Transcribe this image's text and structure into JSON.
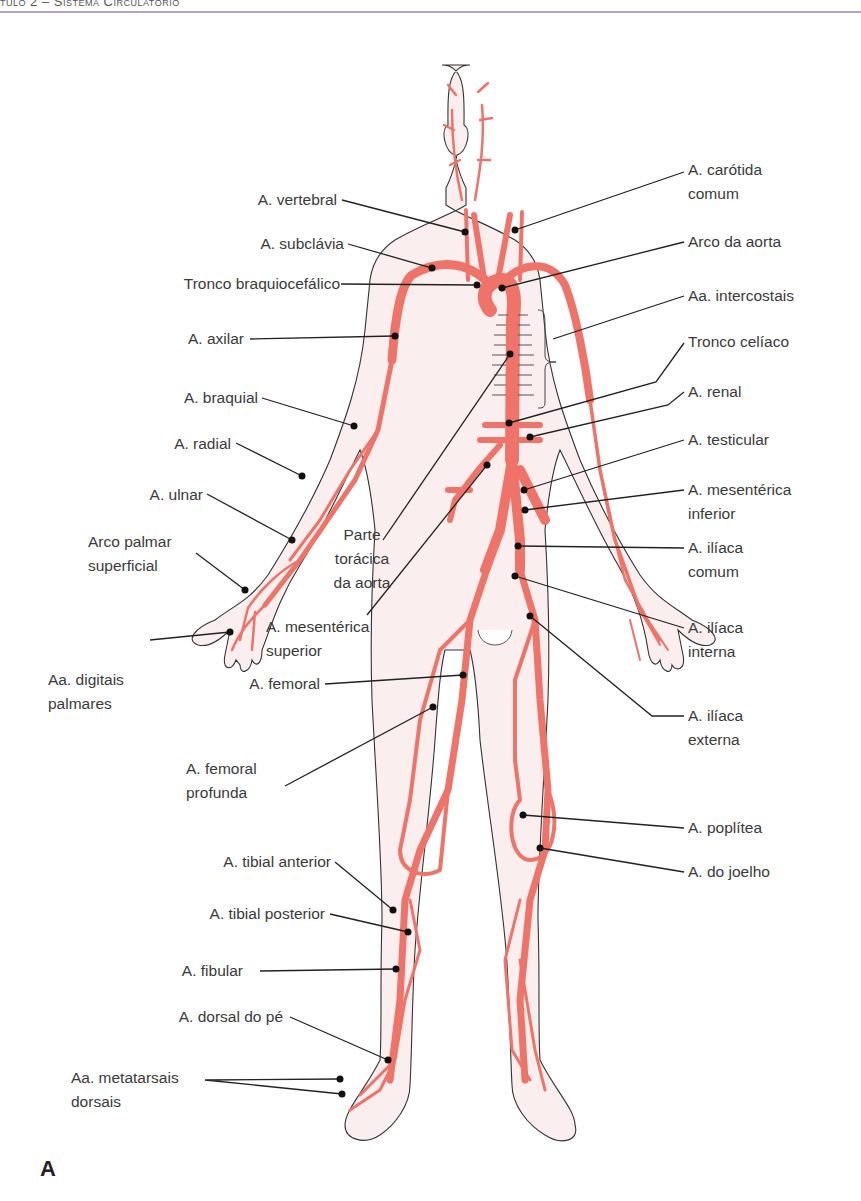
{
  "header": {
    "chapter_text": "tulo 2 – Sistema Circulatório",
    "rule_color": "#b9a0c9"
  },
  "figure": {
    "panel_letter": "A",
    "artery_color": "#ef7368",
    "skin_color": "#fbeeee",
    "outline_color": "#333333",
    "labels_left": [
      {
        "id": "vertebral",
        "text": "A. vertebral"
      },
      {
        "id": "subclavia",
        "text": "A. subclávia"
      },
      {
        "id": "tronco_braquiocefalico",
        "text": "Tronco braquiocefálico"
      },
      {
        "id": "axilar",
        "text": "A. axilar"
      },
      {
        "id": "braquial",
        "text": "A. braquial"
      },
      {
        "id": "radial",
        "text": "A. radial"
      },
      {
        "id": "ulnar",
        "text": "A. ulnar"
      },
      {
        "id": "arco_palmar",
        "line1": "Arco palmar",
        "line2": "superficial"
      },
      {
        "id": "digitais_palmares",
        "line1": "Aa. digitais",
        "line2": "palmares"
      },
      {
        "id": "femoral",
        "text": "A. femoral"
      },
      {
        "id": "femoral_profunda",
        "line1": "A. femoral",
        "line2": "profunda"
      },
      {
        "id": "tibial_anterior",
        "text": "A. tibial anterior"
      },
      {
        "id": "tibial_posterior",
        "text": "A. tibial posterior"
      },
      {
        "id": "fibular",
        "text": "A. fibular"
      },
      {
        "id": "dorsal_pe",
        "text": "A. dorsal do pé"
      },
      {
        "id": "metatarsais",
        "line1": "Aa. metatarsais",
        "line2": "dorsais"
      }
    ],
    "labels_center": [
      {
        "id": "parte_toracica",
        "line1": "Parte",
        "line2": "torácica",
        "line3": "da aorta"
      },
      {
        "id": "mesenterica_superior",
        "line1": "A. mesentérica",
        "line2": "superior"
      }
    ],
    "labels_right": [
      {
        "id": "carotida",
        "line1": "A. carótida",
        "line2": "comum"
      },
      {
        "id": "arco_aorta",
        "text": "Arco da aorta"
      },
      {
        "id": "intercostais",
        "text": "Aa. intercostais"
      },
      {
        "id": "tronco_celiaco",
        "text": "Tronco celíaco"
      },
      {
        "id": "renal",
        "text": "A. renal"
      },
      {
        "id": "testicular",
        "text": "A. testicular"
      },
      {
        "id": "mesenterica_inferior",
        "line1": "A. mesentérica",
        "line2": "inferior"
      },
      {
        "id": "iliaca_comum",
        "line1": "A. ilíaca",
        "line2": "comum"
      },
      {
        "id": "iliaca_interna",
        "line1": "A. ilíaca",
        "line2": "interna"
      },
      {
        "id": "iliaca_externa",
        "line1": "A. ilíaca",
        "line2": "externa"
      },
      {
        "id": "poplitea",
        "text": "A. poplítea"
      },
      {
        "id": "joelho",
        "text": "A. do joelho"
      }
    ]
  }
}
